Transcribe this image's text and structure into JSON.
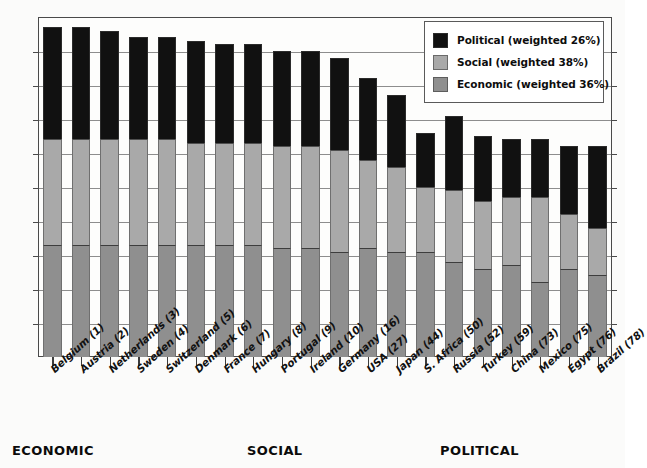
{
  "chart_data": {
    "type": "bar",
    "subtype": "stacked-bar",
    "title": "",
    "xlabel": "",
    "ylabel": "",
    "ylim": [
      0,
      100
    ],
    "grid": true,
    "gridline_count": 9,
    "legend_position": "top-right",
    "stack_order_bottom_to_top": [
      "Economic",
      "Social",
      "Political"
    ],
    "categories": [
      "Belgium (1)",
      "Austria (2)",
      "Netherlands (3)",
      "Sweden (4)",
      "Switzerland (5)",
      "Denmark (6)",
      "France (7)",
      "Hungary (8)",
      "Portugal (9)",
      "Ireland (10)",
      "Germany (16)",
      "USA (27)",
      "Japan (44)",
      "S. Africa (50)",
      "Russia (52)",
      "Turkey (59)",
      "China (73)",
      "Mexico (75)",
      "Egypt (76)",
      "Brazil (78)"
    ],
    "series": [
      {
        "name": "Economic",
        "legend_label": "Economic (weighted 36%)",
        "weight_pct": 36,
        "color": "#8f8f8f",
        "values": [
          33,
          33,
          33,
          33,
          33,
          33,
          33,
          33,
          32,
          32,
          31,
          32,
          31,
          31,
          28,
          26,
          27,
          22,
          26,
          24
        ]
      },
      {
        "name": "Social",
        "legend_label": "Social (weighted 38%)",
        "weight_pct": 38,
        "color": "#a9a9a9",
        "values": [
          31,
          31,
          31,
          31,
          31,
          30,
          30,
          30,
          30,
          30,
          30,
          26,
          25,
          19,
          21,
          20,
          20,
          25,
          16,
          14
        ]
      },
      {
        "name": "Political",
        "legend_label": "Political (weighted 26%)",
        "weight_pct": 26,
        "color": "#111111",
        "values": [
          33,
          33,
          32,
          30,
          30,
          30,
          29,
          29,
          28,
          28,
          27,
          24,
          21,
          16,
          22,
          19,
          17,
          17,
          20,
          24
        ]
      }
    ],
    "totals": [
      97,
      97,
      96,
      94,
      94,
      93,
      92,
      92,
      90,
      90,
      88,
      82,
      77,
      66,
      71,
      65,
      64,
      64,
      62,
      62
    ]
  },
  "legend": {
    "items": [
      {
        "label": "Political (weighted 26%)",
        "swatch": "political-swatch"
      },
      {
        "label": "Social (weighted 38%)",
        "swatch": "social-swatch"
      },
      {
        "label": "Economic (weighted 36%)",
        "swatch": "economic-swatch"
      }
    ]
  },
  "section_captions": [
    {
      "label": "ECONOMIC",
      "left_px": 12
    },
    {
      "label": "SOCIAL",
      "left_px": 247
    },
    {
      "label": "POLITICAL",
      "left_px": 440
    }
  ]
}
